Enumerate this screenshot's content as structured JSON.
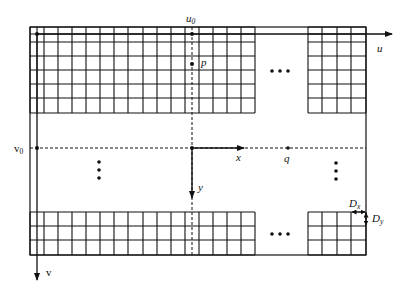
{
  "diagram": {
    "type": "image tiling / coordinate system diagram",
    "axes": {
      "u_label": "u",
      "v_label": "v",
      "u0_label": "u",
      "u0_sub": "0",
      "v0_label": "v",
      "v0_sub": "0",
      "x_label": "x",
      "y_label": "y"
    },
    "points": {
      "p_label": "p",
      "q_label": "q"
    },
    "spacing": {
      "dx_label": "D",
      "dx_sub": "x",
      "dy_label": "D",
      "dy_sub": "y"
    },
    "ellipsis": "•••",
    "colors": {
      "line": "#111111",
      "background": "#ffffff"
    }
  }
}
